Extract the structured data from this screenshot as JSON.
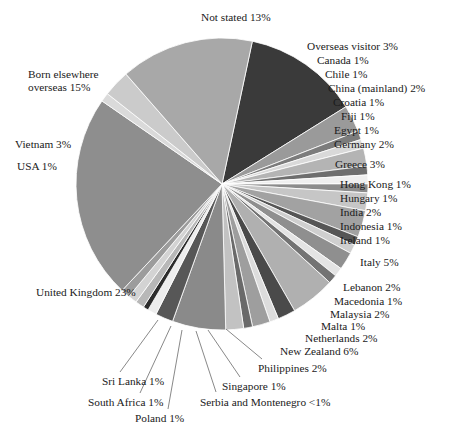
{
  "figure": {
    "title_cut_off": "",
    "geometry": {
      "cx": 222,
      "cy": 184,
      "r": 146,
      "start_angle_deg": -78
    }
  },
  "chart_data": {
    "type": "pie",
    "title": "",
    "subtitle": "",
    "xlabel": "",
    "ylabel": "",
    "legend_position": "callout-labels",
    "grid": false,
    "value_unit": "%",
    "categories": [
      "Not stated",
      "Overseas visitor",
      "Canada",
      "Chile",
      "China (mainland)",
      "Croatia",
      "Fiji",
      "Egypt",
      "Germany",
      "Greece",
      "Hong Kong",
      "Hungary",
      "India",
      "Indonesia",
      "Ireland",
      "Italy",
      "Lebanon",
      "Macedonia",
      "Malaysia",
      "Malta",
      "Netherlands",
      "New Zealand",
      "Philippines",
      "Singapore",
      "Serbia and Montenegro",
      "Poland",
      "South Africa",
      "Sri Lanka",
      "United Kingdom",
      "USA",
      "Vietnam",
      "Born elsewhere overseas"
    ],
    "values": [
      13,
      3,
      1,
      1,
      2,
      1,
      1,
      1,
      2,
      3,
      1,
      1,
      2,
      1,
      1,
      5,
      2,
      1,
      2,
      1,
      2,
      6,
      2,
      1,
      0.6,
      1,
      1,
      1,
      23,
      1,
      3,
      15
    ],
    "labels": [
      "Not stated 13%",
      "Overseas visitor 3%",
      "Canada 1%",
      "Chile 1%",
      "China (mainland) 2%",
      "Croatia 1%",
      "Fiji 1%",
      "Egypt 1%",
      "Germany 2%",
      "Greece 3%",
      "Hong Kong 1%",
      "Hungary 1%",
      "India 2%",
      "Indonesia 1%",
      "Ireland 1%",
      "Italy 5%",
      "Lebanon 2%",
      "Macedonia 1%",
      "Malaysia 2%",
      "Malta 1%",
      "Netherlands 2%",
      "New Zealand 6%",
      "Philippines 2%",
      "Singapore 1%",
      "Serbia and Montenegro <1%",
      "Poland 1%",
      "South Africa 1%",
      "Sri Lanka 1%",
      "United Kingdom 23%",
      "USA 1%",
      "Vietnam 3%",
      "Born elsewhere overseas 15%"
    ],
    "colors": [
      "#3a3a3a",
      "#9a9a9a",
      "#7c7c7c",
      "#d9d9d9",
      "#b4b4b4",
      "#6e6e6e",
      "#efefef",
      "#8c8c8c",
      "#c6c6c6",
      "#a2a2a2",
      "#565656",
      "#cfcfcf",
      "#8f8f8f",
      "#e4e4e4",
      "#737373",
      "#b0b0b0",
      "#4a4a4a",
      "#dcdcdc",
      "#9e9e9e",
      "#6a6a6a",
      "#c2c2c2",
      "#8a8a8a",
      "#575757",
      "#ededed",
      "#2c2c2c",
      "#b8b8b8",
      "#d3d3d3",
      "#9c9c9c",
      "#8e8e8e",
      "#dadada",
      "#cbcbcb",
      "#a8a8a8"
    ]
  },
  "labels": {
    "not_stated": "Not stated 13%",
    "overseas_visitor": "Overseas visitor 3%",
    "canada": "Canada 1%",
    "chile": "Chile 1%",
    "china": "China (mainland) 2%",
    "croatia": "Croatia 1%",
    "fiji": "Fiji 1%",
    "egypt": "Egypt 1%",
    "germany": "Germany 2%",
    "greece": "Greece 3%",
    "hong_kong": "Hong Kong 1%",
    "hungary": "Hungary 1%",
    "india": "India 2%",
    "indonesia": "Indonesia 1%",
    "ireland": "Ireland 1%",
    "italy": "Italy 5%",
    "lebanon": "Lebanon 2%",
    "macedonia": "Macedonia 1%",
    "malaysia": "Malaysia 2%",
    "malta": "Malta 1%",
    "netherlands": "Netherlands 2%",
    "new_zealand": "New Zealand 6%",
    "philippines": "Philippines 2%",
    "singapore": "Singapore 1%",
    "serbia": "Serbia and Montenegro <1%",
    "poland": "Poland 1%",
    "south_africa": "South Africa 1%",
    "sri_lanka": "Sri Lanka 1%",
    "united_kingdom": "United Kingdom 23%",
    "usa": "USA 1%",
    "vietnam": "Vietnam 3%",
    "born_elsewhere": "Born elsewhere overseas 15%"
  }
}
